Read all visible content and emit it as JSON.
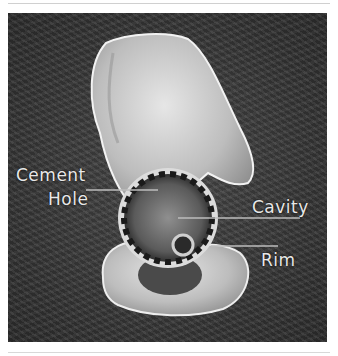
{
  "figure": {
    "labels": {
      "cement": "Cement",
      "hole": "Hole",
      "cavity": "Cavity",
      "rim": "Rim"
    },
    "colors": {
      "background": "#383838",
      "bone": "#d8d8d8",
      "label_text": "#e8e8e8",
      "leader_line": "#bdbdbd"
    }
  }
}
